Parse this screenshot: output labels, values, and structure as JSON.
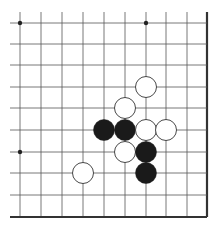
{
  "board": {
    "columns_x": [
      20,
      41,
      62,
      83,
      104,
      125,
      146,
      166,
      187,
      207
    ],
    "rows_y": [
      23,
      44,
      65,
      87,
      108,
      130,
      152,
      173,
      195,
      217
    ],
    "extend_left_to": 10,
    "extend_top_to": 12,
    "edge_right": true,
    "edge_bottom": true,
    "line_color": "#555555",
    "edge_color": "#333333",
    "stone_radius": 10.5
  },
  "hoshi": [
    {
      "col": 0,
      "row": 0
    },
    {
      "col": 6,
      "row": 0
    },
    {
      "col": 0,
      "row": 6
    }
  ],
  "stones": [
    {
      "color": "white",
      "col": 6,
      "row": 3
    },
    {
      "color": "white",
      "col": 5,
      "row": 4
    },
    {
      "color": "black",
      "col": 4,
      "row": 5
    },
    {
      "color": "black",
      "col": 5,
      "row": 5
    },
    {
      "color": "white",
      "col": 6,
      "row": 5
    },
    {
      "color": "white",
      "col": 7,
      "row": 5
    },
    {
      "color": "white",
      "col": 5,
      "row": 6
    },
    {
      "color": "black",
      "col": 6,
      "row": 6
    },
    {
      "color": "black",
      "col": 6,
      "row": 7
    },
    {
      "color": "white",
      "col": 3,
      "row": 7
    }
  ],
  "colors": {
    "black_stone": "#1a1a1a",
    "white_stone": "#ffffff",
    "white_stone_outline": "#333333",
    "background": "#ffffff"
  }
}
